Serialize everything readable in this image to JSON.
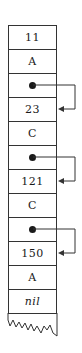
{
  "diagram": {
    "type": "memory-stack",
    "cells": [
      {
        "kind": "value",
        "label": "11"
      },
      {
        "kind": "value",
        "label": "A"
      },
      {
        "kind": "pointer",
        "label": ""
      },
      {
        "kind": "value",
        "label": "23"
      },
      {
        "kind": "value",
        "label": "C"
      },
      {
        "kind": "pointer",
        "label": ""
      },
      {
        "kind": "value",
        "label": "121"
      },
      {
        "kind": "value",
        "label": "C"
      },
      {
        "kind": "pointer",
        "label": ""
      },
      {
        "kind": "value",
        "label": "150"
      },
      {
        "kind": "value",
        "label": "A"
      },
      {
        "kind": "value",
        "label": "nil",
        "italic": true
      }
    ],
    "pointers": [
      {
        "from_cell": 2,
        "to_cell": 3
      },
      {
        "from_cell": 5,
        "to_cell": 6
      },
      {
        "from_cell": 8,
        "to_cell": 9
      }
    ],
    "bottom": "torn-edge"
  }
}
